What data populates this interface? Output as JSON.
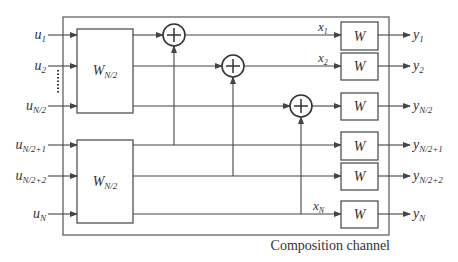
{
  "diagram": {
    "caption": "Composition channel",
    "inputs": [
      {
        "base": "u",
        "sub": "1"
      },
      {
        "base": "u",
        "sub": "2"
      },
      {
        "base": "u",
        "sub": "N/2"
      },
      {
        "base": "u",
        "sub": "N/2+1"
      },
      {
        "base": "u",
        "sub": "N/2+2"
      },
      {
        "base": "u",
        "sub": "N"
      }
    ],
    "blocks": [
      {
        "base": "W",
        "sub": "N/2"
      },
      {
        "base": "W",
        "sub": "N/2"
      }
    ],
    "xor_nodes": [
      "+",
      "+",
      "+"
    ],
    "intermediate": [
      {
        "base": "x",
        "sub": "1"
      },
      {
        "base": "x",
        "sub": "2"
      },
      {
        "base": "x",
        "sub": "N"
      }
    ],
    "channels": [
      "W",
      "W",
      "W",
      "W",
      "W",
      "W"
    ],
    "outputs": [
      {
        "base": "y",
        "sub": "1"
      },
      {
        "base": "y",
        "sub": "2"
      },
      {
        "base": "y",
        "sub": "N/2"
      },
      {
        "base": "y",
        "sub": "N/2+1"
      },
      {
        "base": "y",
        "sub": "N/2+2"
      },
      {
        "base": "y",
        "sub": "N"
      }
    ],
    "colors": {
      "line": "#444444",
      "text": "#333333",
      "background": "#ffffff"
    }
  }
}
